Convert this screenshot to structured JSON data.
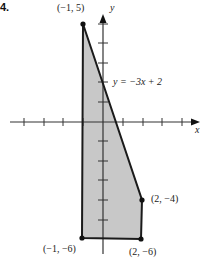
{
  "problem_number": "4.",
  "axes": {
    "x_label": "x",
    "y_label": "y"
  },
  "line_label": "y = −3x + 2",
  "vertices": [
    {
      "label": "(−1, 5)",
      "x": -1,
      "y": 5
    },
    {
      "label": "(2, −4)",
      "x": 2,
      "y": -4
    },
    {
      "label": "(2, −6)",
      "x": 2,
      "y": -6
    },
    {
      "label": "(−1, −6)",
      "x": -1,
      "y": -6
    }
  ],
  "colors": {
    "fill": "#c8c8c8",
    "stroke": "#1a1a1a",
    "axis": "#333333"
  }
}
